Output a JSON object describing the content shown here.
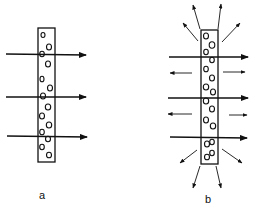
{
  "panels": [
    {
      "label": "a",
      "description": "membrane with particles, straight transmission"
    },
    {
      "label": "b",
      "description": "membrane with particles, transmission plus scattering"
    }
  ],
  "colors": {
    "ink": "#111111",
    "background": "#ffffff"
  }
}
